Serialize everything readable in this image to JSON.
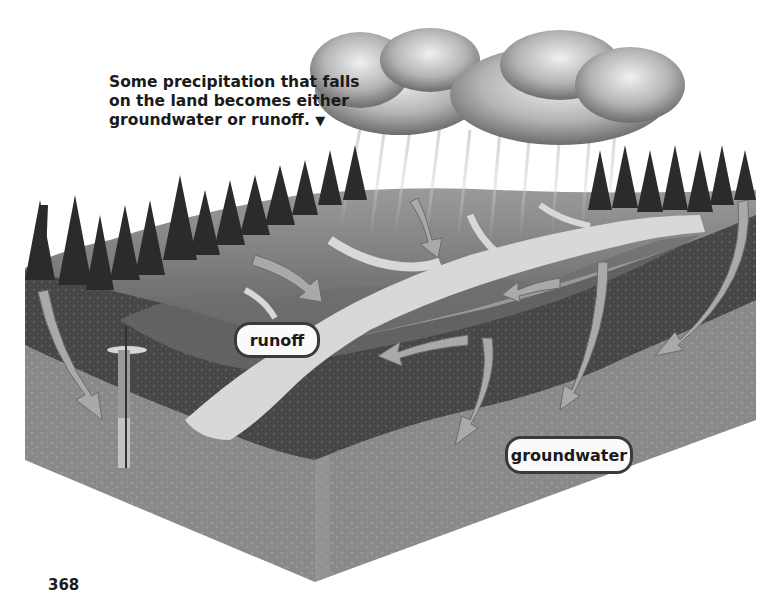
{
  "caption": {
    "lines": [
      "Some precipitation that falls",
      "on the land becomes either",
      "groundwater or runoff."
    ],
    "pointer_glyph": "▼"
  },
  "labels": {
    "runoff": "runoff",
    "groundwater": "groundwater"
  },
  "page_number": "368",
  "diagram": {
    "elements": [
      "rain-cloud",
      "rain-streaks",
      "conifer-forest",
      "hill-surface",
      "river-channels",
      "runoff-arrows",
      "groundwater-arrows",
      "well-pipe",
      "soil-layer",
      "bedrock-layer"
    ],
    "colors": {
      "sky_cloud_light": "#e8e8e8",
      "cloud_dark": "#6e6e6e",
      "trees": "#2b2b2b",
      "land_surface": "#7a7a7a",
      "river": "#d8d8d8",
      "arrow": "#a9a9a9",
      "soil_dark": "#4a4a4a",
      "bedrock": "#8c8c8c"
    }
  }
}
